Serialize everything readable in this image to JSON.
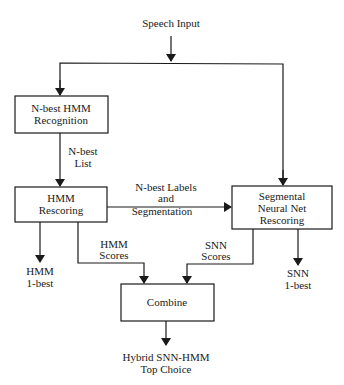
{
  "diagram": {
    "input": "Speech Input",
    "boxes": {
      "nbest_recognition": [
        "N-best HMM",
        "Recognition"
      ],
      "hmm_rescoring": [
        "HMM",
        "Rescoring"
      ],
      "snn_rescoring": [
        "Segmental",
        "Neural Net",
        "Rescoring"
      ],
      "combine": [
        "Combine"
      ]
    },
    "edge_labels": {
      "nbest_list": [
        "N-best",
        "List"
      ],
      "labels_segmentation": [
        "N-best Labels",
        "and",
        "Segmentation"
      ],
      "hmm_scores": [
        "HMM",
        "Scores"
      ],
      "snn_scores": [
        "SNN",
        "Scores"
      ]
    },
    "outputs": {
      "hmm_1best": [
        "HMM",
        "1-best"
      ],
      "snn_1best": [
        "SNN",
        "1-best"
      ],
      "hybrid": [
        "Hybrid SNN-HMM",
        "Top Choice"
      ]
    }
  }
}
